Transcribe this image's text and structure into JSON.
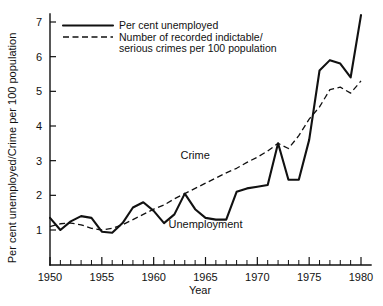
{
  "chart_data": {
    "type": "line",
    "title": "",
    "xlabel": "Year",
    "ylabel": "Per cent unemployed/Crime per 100 population",
    "xlim": [
      1950,
      1980
    ],
    "ylim": [
      0,
      7.5
    ],
    "xticks": [
      1950,
      1955,
      1960,
      1965,
      1970,
      1975,
      1980
    ],
    "xtick_labels": [
      "1950",
      "1955",
      "1960",
      "1965",
      "1970",
      "1975",
      "1980"
    ],
    "yticks": [
      1,
      2,
      3,
      4,
      5,
      6,
      7
    ],
    "ytick_labels": [
      "1",
      "2",
      "3",
      "4",
      "5",
      "6",
      "7"
    ],
    "minor_xtick_step": 1,
    "grid": false,
    "legend_position": "top-left",
    "x": [
      1950,
      1951,
      1952,
      1953,
      1954,
      1955,
      1956,
      1957,
      1958,
      1959,
      1960,
      1961,
      1962,
      1963,
      1964,
      1965,
      1966,
      1967,
      1968,
      1969,
      1970,
      1971,
      1972,
      1973,
      1974,
      1975,
      1976,
      1977,
      1978,
      1979,
      1980
    ],
    "series": [
      {
        "name": "Per cent unemployed",
        "style": "solid",
        "inline_label": "Unemployment",
        "values": [
          1.35,
          1.0,
          1.25,
          1.4,
          1.35,
          0.95,
          0.92,
          1.2,
          1.65,
          1.8,
          1.55,
          1.2,
          1.45,
          2.05,
          1.6,
          1.35,
          1.3,
          1.3,
          2.1,
          2.2,
          2.25,
          2.3,
          3.5,
          2.45,
          2.45,
          3.6,
          5.6,
          5.9,
          5.8,
          5.4,
          7.2
        ]
      },
      {
        "name": "Number of recorded indictable/serious crimes per 100 population",
        "style": "dashed",
        "inline_label": "Crime",
        "values": [
          1.1,
          1.18,
          1.2,
          1.15,
          1.05,
          1.0,
          1.05,
          1.15,
          1.3,
          1.45,
          1.6,
          1.72,
          1.9,
          2.05,
          2.2,
          2.35,
          2.5,
          2.65,
          2.78,
          2.95,
          3.1,
          3.28,
          3.5,
          3.35,
          3.72,
          4.2,
          4.55,
          5.05,
          5.12,
          4.95,
          5.3
        ]
      }
    ],
    "legend": [
      {
        "label": "Per cent unemployed",
        "style": "solid"
      },
      {
        "label": "Number of recorded indictable/",
        "label_line2": "serious crimes per 100 population",
        "style": "dashed"
      }
    ],
    "annotations": [
      {
        "text": "Crime",
        "x": 1964.0,
        "y": 3.05
      },
      {
        "text": "Unemployment",
        "x": 1965.0,
        "y": 1.05
      }
    ]
  }
}
